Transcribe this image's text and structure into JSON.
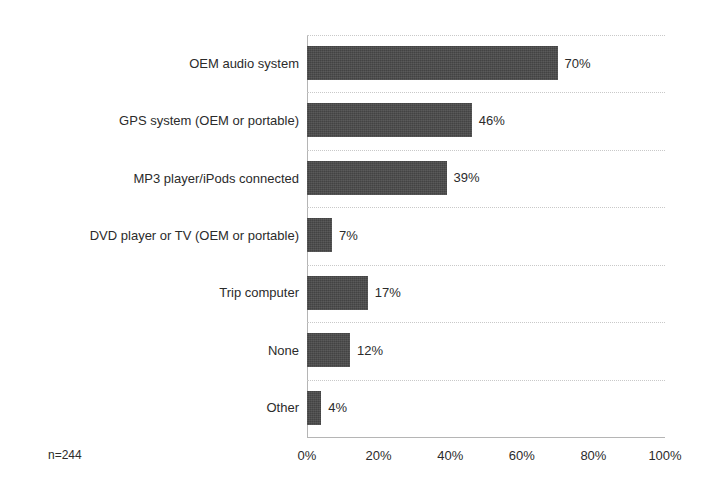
{
  "chart_data": {
    "type": "bar",
    "orientation": "horizontal",
    "title": "",
    "subtitle": "",
    "xlabel": "",
    "ylabel": "",
    "xlim": [
      0,
      100
    ],
    "grid": true,
    "legend": null,
    "categories": [
      "OEM audio system",
      "GPS system (OEM or portable)",
      "MP3 player/iPods connected",
      "DVD player or TV (OEM or portable)",
      "Trip computer",
      "None",
      "Other"
    ],
    "values": [
      70,
      46,
      39,
      7,
      17,
      12,
      4
    ],
    "data_labels": [
      "70%",
      "46%",
      "39%",
      "7%",
      "17%",
      "12%",
      "4%"
    ],
    "xticks": [
      0,
      20,
      40,
      60,
      80,
      100
    ],
    "xtick_labels": [
      "0%",
      "20%",
      "40%",
      "60%",
      "80%",
      "100%"
    ],
    "annotations": [
      "n=244"
    ],
    "bar_color": "#4a4a4a",
    "grid_color": "#c9c9c9",
    "axis_color": "#b5b5b5",
    "background": "#ffffff"
  },
  "notes": {
    "sample_size": "n=244"
  }
}
